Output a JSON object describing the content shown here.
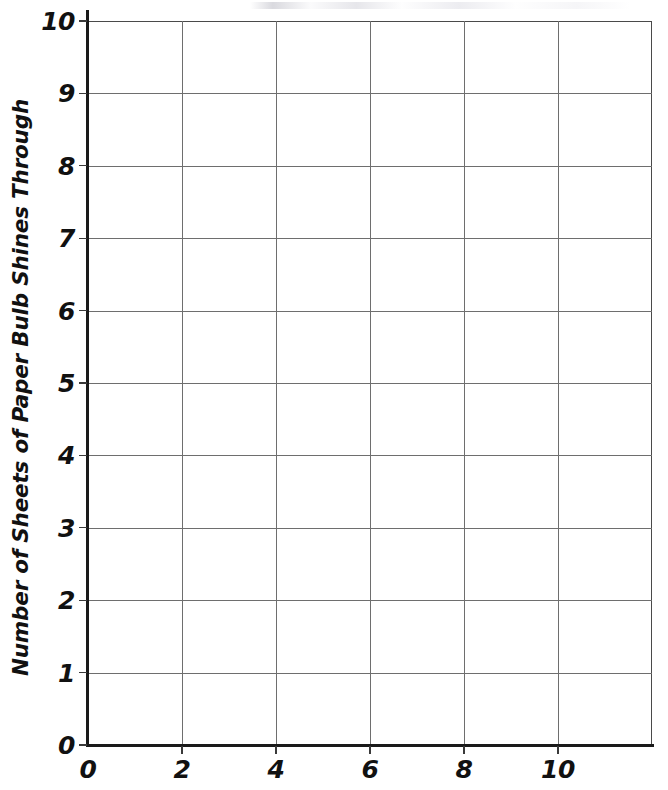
{
  "page": {
    "width": 668,
    "height": 790,
    "background_color": "#ffffff",
    "kind": "blank-graph-grid-worksheet"
  },
  "chart_data": {
    "type": "line",
    "title": "",
    "subtitle": "",
    "xlabel": "",
    "ylabel": "Number of Sheets of Paper Bulb Shines Through",
    "xlim": [
      0,
      12
    ],
    "ylim": [
      0,
      10
    ],
    "x_tick_labels": [
      "0",
      "2",
      "4",
      "6",
      "8",
      "10"
    ],
    "x_tick_values": [
      0,
      2,
      4,
      6,
      8,
      10
    ],
    "x_major_step": 2,
    "y_tick_labels": [
      "0",
      "1",
      "2",
      "3",
      "4",
      "5",
      "6",
      "7",
      "8",
      "9",
      "10"
    ],
    "y_tick_values": [
      0,
      1,
      2,
      3,
      4,
      5,
      6,
      7,
      8,
      9,
      10
    ],
    "y_major_step": 1,
    "grid": true,
    "grid_color": "#6e6e6e",
    "axis_color": "#1a1a1a",
    "legend": false,
    "legend_position": "none",
    "series": [],
    "values": [],
    "categories": [],
    "annotations": [],
    "note": "Empty coordinate grid — no data plotted; axes and gridlines only"
  },
  "axes": {
    "y_title": "Number of Sheets of Paper Bulb Shines Through",
    "x_title": "",
    "y_labels": [
      "10",
      "9",
      "8",
      "7",
      "6",
      "5",
      "4",
      "3",
      "2",
      "1",
      "0"
    ],
    "x_labels": [
      "0",
      "2",
      "4",
      "6",
      "8",
      "10"
    ]
  }
}
